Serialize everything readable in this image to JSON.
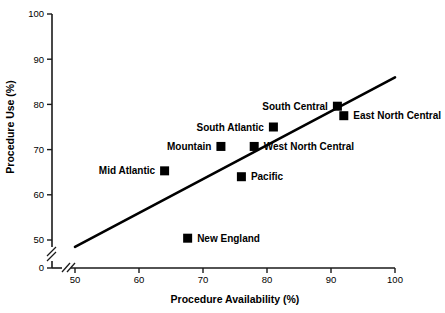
{
  "chart_data": {
    "type": "scatter",
    "title": "",
    "xlabel": "Procedure Availability (%)",
    "ylabel": "Procedure Use (%)",
    "xlim": [
      50,
      100
    ],
    "ylim": [
      50,
      100
    ],
    "x_ticks": [
      "50",
      "60",
      "70",
      "80",
      "90",
      "100"
    ],
    "y_ticks": [
      "0",
      "50",
      "60",
      "70",
      "80",
      "90",
      "100"
    ],
    "grid": false,
    "legend": "none",
    "axis_break": {
      "x_axis": true,
      "y_axis": true,
      "note": "Both axes are broken between 0 and 50"
    },
    "points": [
      {
        "label": "Mid Atlantic",
        "x": 64.0,
        "y": 65.3,
        "label_side": "left"
      },
      {
        "label": "Mountain",
        "x": 72.8,
        "y": 70.7,
        "label_side": "left"
      },
      {
        "label": "South Atlantic",
        "x": 81.0,
        "y": 75.0,
        "label_side": "left"
      },
      {
        "label": "West North Central",
        "x": 78.0,
        "y": 70.7,
        "label_side": "right"
      },
      {
        "label": "South Central",
        "x": 91.0,
        "y": 79.6,
        "label_side": "left"
      },
      {
        "label": "East North Central",
        "x": 92.0,
        "y": 77.5,
        "label_side": "right"
      },
      {
        "label": "Pacific",
        "x": 76.0,
        "y": 64.0,
        "label_side": "right"
      },
      {
        "label": "New England",
        "x": 67.6,
        "y": 50.4,
        "label_side": "right"
      }
    ],
    "trend_line": {
      "x0": 50.0,
      "y0": 48.5,
      "x1": 100.0,
      "y1": 86.0
    },
    "colors": {
      "marker": "#000000",
      "line": "#000000",
      "axis": "#1a1a1a",
      "background": "#ffffff"
    }
  }
}
